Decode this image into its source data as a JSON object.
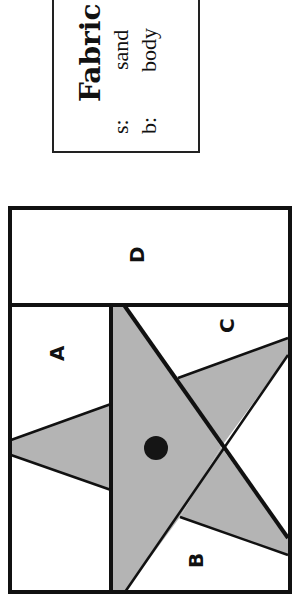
{
  "legend": {
    "title": "Fabric",
    "items": [
      {
        "key": "s:",
        "value": "sand"
      },
      {
        "key": "b:",
        "value": "body"
      }
    ]
  },
  "diagram": {
    "regions": [
      "A",
      "B",
      "C",
      "D"
    ],
    "colors": {
      "star_fill": "#b4b4b4",
      "line": "#111111",
      "background": "#ffffff",
      "dot": "#151515"
    }
  }
}
